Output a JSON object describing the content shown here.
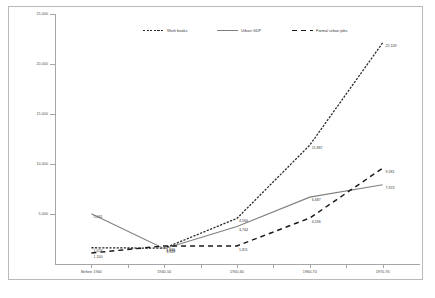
{
  "chart_data": {
    "type": "line",
    "title": "",
    "xlabel": "",
    "ylabel": "",
    "ylim": [
      0,
      25000
    ],
    "grid": false,
    "legend_position": "top-center",
    "categories": [
      "Before 1940",
      "1940-50",
      "1950-60",
      "1960-70",
      "1970-76"
    ],
    "yticks": [
      "25,000",
      "20,000",
      "15,000",
      "10,000",
      "5,000"
    ],
    "ytick_values": [
      25000,
      20000,
      15000,
      10000,
      5000
    ],
    "series": [
      {
        "name": "Work books",
        "style": "dotted",
        "color": "#2b2b2b",
        "values": [
          1626,
          1578,
          4566,
          11887,
          22109
        ],
        "labels": [
          "1,626",
          "1,578",
          "4,566",
          "11,887",
          "22,109"
        ]
      },
      {
        "name": "Urban GDP",
        "style": "solid",
        "color": "#7f7f7f",
        "values": [
          5031,
          1522,
          3744,
          6687,
          7923
        ],
        "labels": [
          "5,031",
          "1,522",
          "3,744",
          "6,687",
          "7,923"
        ]
      },
      {
        "name": "Formal urban jobs",
        "style": "dashed",
        "color": "#1a1a1a",
        "values": [
          1100,
          1811,
          1811,
          4596,
          9581
        ],
        "labels": [
          "1,100",
          "1,811",
          "1,811",
          "4,596",
          "9,581"
        ]
      }
    ]
  },
  "legend": {
    "items": [
      {
        "label": "Work books"
      },
      {
        "label": "Urban GDP"
      },
      {
        "label": "Formal urban jobs"
      }
    ]
  }
}
